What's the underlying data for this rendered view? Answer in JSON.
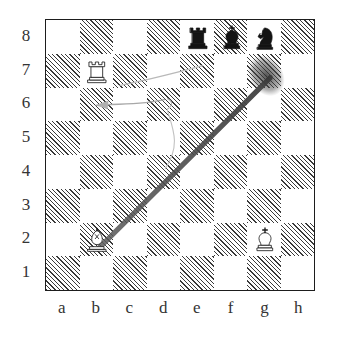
{
  "diagram": {
    "orientation": "white-bottom",
    "rank_labels": [
      "8",
      "7",
      "6",
      "5",
      "4",
      "3",
      "2",
      "1"
    ],
    "file_labels": [
      "a",
      "b",
      "c",
      "d",
      "e",
      "f",
      "g",
      "h"
    ],
    "colors": {
      "board_border": "#1d1d1d",
      "light_square": "#ffffff",
      "dark_square_hatch": "#3a3a3a",
      "white_piece_fill": "#ffffff",
      "white_piece_stroke": "#1b1b1b",
      "black_piece_fill": "#141414",
      "arrow_main": "#4a4a4a",
      "arrow_faint": "#b4b4b4",
      "page_background": "#ffffff",
      "label_text": "#343434"
    },
    "squares": [
      {
        "id": "a8",
        "file": 0,
        "rank": 0,
        "shade": "light"
      },
      {
        "id": "b8",
        "file": 1,
        "rank": 0,
        "shade": "dark"
      },
      {
        "id": "c8",
        "file": 2,
        "rank": 0,
        "shade": "light"
      },
      {
        "id": "d8",
        "file": 3,
        "rank": 0,
        "shade": "dark"
      },
      {
        "id": "e8",
        "file": 4,
        "rank": 0,
        "shade": "light"
      },
      {
        "id": "f8",
        "file": 5,
        "rank": 0,
        "shade": "dark"
      },
      {
        "id": "g8",
        "file": 6,
        "rank": 0,
        "shade": "light"
      },
      {
        "id": "h8",
        "file": 7,
        "rank": 0,
        "shade": "dark"
      },
      {
        "id": "a7",
        "file": 0,
        "rank": 1,
        "shade": "dark"
      },
      {
        "id": "b7",
        "file": 1,
        "rank": 1,
        "shade": "light"
      },
      {
        "id": "c7",
        "file": 2,
        "rank": 1,
        "shade": "dark"
      },
      {
        "id": "d7",
        "file": 3,
        "rank": 1,
        "shade": "light"
      },
      {
        "id": "e7",
        "file": 4,
        "rank": 1,
        "shade": "dark"
      },
      {
        "id": "f7",
        "file": 5,
        "rank": 1,
        "shade": "light"
      },
      {
        "id": "g7",
        "file": 6,
        "rank": 1,
        "shade": "dark"
      },
      {
        "id": "h7",
        "file": 7,
        "rank": 1,
        "shade": "light"
      },
      {
        "id": "a6",
        "file": 0,
        "rank": 2,
        "shade": "light"
      },
      {
        "id": "b6",
        "file": 1,
        "rank": 2,
        "shade": "dark"
      },
      {
        "id": "c6",
        "file": 2,
        "rank": 2,
        "shade": "light"
      },
      {
        "id": "d6",
        "file": 3,
        "rank": 2,
        "shade": "dark"
      },
      {
        "id": "e6",
        "file": 4,
        "rank": 2,
        "shade": "light"
      },
      {
        "id": "f6",
        "file": 5,
        "rank": 2,
        "shade": "dark"
      },
      {
        "id": "g6",
        "file": 6,
        "rank": 2,
        "shade": "light"
      },
      {
        "id": "h6",
        "file": 7,
        "rank": 2,
        "shade": "dark"
      },
      {
        "id": "a5",
        "file": 0,
        "rank": 3,
        "shade": "dark"
      },
      {
        "id": "b5",
        "file": 1,
        "rank": 3,
        "shade": "light"
      },
      {
        "id": "c5",
        "file": 2,
        "rank": 3,
        "shade": "dark"
      },
      {
        "id": "d5",
        "file": 3,
        "rank": 3,
        "shade": "light"
      },
      {
        "id": "e5",
        "file": 4,
        "rank": 3,
        "shade": "dark"
      },
      {
        "id": "f5",
        "file": 5,
        "rank": 3,
        "shade": "light"
      },
      {
        "id": "g5",
        "file": 6,
        "rank": 3,
        "shade": "dark"
      },
      {
        "id": "h5",
        "file": 7,
        "rank": 3,
        "shade": "light"
      },
      {
        "id": "a4",
        "file": 0,
        "rank": 4,
        "shade": "light"
      },
      {
        "id": "b4",
        "file": 1,
        "rank": 4,
        "shade": "dark"
      },
      {
        "id": "c4",
        "file": 2,
        "rank": 4,
        "shade": "light"
      },
      {
        "id": "d4",
        "file": 3,
        "rank": 4,
        "shade": "dark"
      },
      {
        "id": "e4",
        "file": 4,
        "rank": 4,
        "shade": "light"
      },
      {
        "id": "f4",
        "file": 5,
        "rank": 4,
        "shade": "dark"
      },
      {
        "id": "g4",
        "file": 6,
        "rank": 4,
        "shade": "light"
      },
      {
        "id": "h4",
        "file": 7,
        "rank": 4,
        "shade": "dark"
      },
      {
        "id": "a3",
        "file": 0,
        "rank": 5,
        "shade": "dark"
      },
      {
        "id": "b3",
        "file": 1,
        "rank": 5,
        "shade": "light"
      },
      {
        "id": "c3",
        "file": 2,
        "rank": 5,
        "shade": "dark"
      },
      {
        "id": "d3",
        "file": 3,
        "rank": 5,
        "shade": "light"
      },
      {
        "id": "e3",
        "file": 4,
        "rank": 5,
        "shade": "dark"
      },
      {
        "id": "f3",
        "file": 5,
        "rank": 5,
        "shade": "light"
      },
      {
        "id": "g3",
        "file": 6,
        "rank": 5,
        "shade": "dark"
      },
      {
        "id": "h3",
        "file": 7,
        "rank": 5,
        "shade": "light"
      },
      {
        "id": "a2",
        "file": 0,
        "rank": 6,
        "shade": "light"
      },
      {
        "id": "b2",
        "file": 1,
        "rank": 6,
        "shade": "dark"
      },
      {
        "id": "c2",
        "file": 2,
        "rank": 6,
        "shade": "light"
      },
      {
        "id": "d2",
        "file": 3,
        "rank": 6,
        "shade": "dark"
      },
      {
        "id": "e2",
        "file": 4,
        "rank": 6,
        "shade": "light"
      },
      {
        "id": "f2",
        "file": 5,
        "rank": 6,
        "shade": "dark"
      },
      {
        "id": "g2",
        "file": 6,
        "rank": 6,
        "shade": "light"
      },
      {
        "id": "h2",
        "file": 7,
        "rank": 6,
        "shade": "dark"
      },
      {
        "id": "a1",
        "file": 0,
        "rank": 7,
        "shade": "dark"
      },
      {
        "id": "b1",
        "file": 1,
        "rank": 7,
        "shade": "light"
      },
      {
        "id": "c1",
        "file": 2,
        "rank": 7,
        "shade": "dark"
      },
      {
        "id": "d1",
        "file": 3,
        "rank": 7,
        "shade": "light"
      },
      {
        "id": "e1",
        "file": 4,
        "rank": 7,
        "shade": "dark"
      },
      {
        "id": "f1",
        "file": 5,
        "rank": 7,
        "shade": "light"
      },
      {
        "id": "g1",
        "file": 6,
        "rank": 7,
        "shade": "dark"
      },
      {
        "id": "h1",
        "file": 7,
        "rank": 7,
        "shade": "light"
      }
    ],
    "pieces": [
      {
        "square": "e8",
        "file": 4,
        "rank": 0,
        "color": "black",
        "type": "rook",
        "icon": "black-rook-icon",
        "symbol": "♜"
      },
      {
        "square": "f8",
        "file": 5,
        "rank": 0,
        "color": "black",
        "type": "king",
        "icon": "black-king-icon",
        "symbol": "♚"
      },
      {
        "square": "g8",
        "file": 6,
        "rank": 0,
        "color": "black",
        "type": "knight",
        "icon": "black-knight-icon",
        "symbol": "♞"
      },
      {
        "square": "b7",
        "file": 1,
        "rank": 1,
        "color": "white",
        "type": "rook",
        "icon": "white-rook-icon",
        "symbol": "♖"
      },
      {
        "square": "b2",
        "file": 1,
        "rank": 6,
        "color": "white",
        "type": "bishop",
        "icon": "white-bishop-icon",
        "symbol": "♗"
      },
      {
        "square": "g2",
        "file": 6,
        "rank": 6,
        "color": "white",
        "type": "king",
        "icon": "white-king-icon",
        "symbol": "♔"
      }
    ],
    "arrows": [
      {
        "name": "bishop-diagonal-arrow",
        "from": "b2",
        "to": "h8",
        "style": "thick-dark",
        "description": "thick diagonal from b2 through g7 to h8"
      },
      {
        "name": "faint-curve-arrow-a6",
        "from": "e8",
        "to": "a6",
        "style": "faint-curve",
        "description": "faint curved line ending with arrowhead at a6"
      },
      {
        "name": "faint-curve-arrow-d5",
        "from": "d6",
        "to": "c4",
        "style": "faint-curve",
        "description": "faint curve descending near d5"
      }
    ]
  }
}
